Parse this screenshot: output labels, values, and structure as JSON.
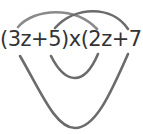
{
  "diagram": {
    "expression": "(3z+5)x(2z+7)",
    "arc_color": "#6b6b6b",
    "arc_color_light": "#8a8a8a",
    "text_color": "#333333",
    "arcs": [
      {
        "name": "first",
        "connects": [
          "3z",
          "2z"
        ],
        "position": "top"
      },
      {
        "name": "last",
        "connects": [
          "5",
          "7"
        ],
        "position": "top"
      },
      {
        "name": "outer",
        "connects": [
          "3z",
          "7"
        ],
        "position": "bottom"
      },
      {
        "name": "inner",
        "connects": [
          "5",
          "2z"
        ],
        "position": "bottom"
      }
    ]
  }
}
